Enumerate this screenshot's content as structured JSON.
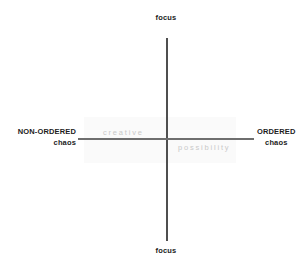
{
  "diagram": {
    "background_color": "#ffffff",
    "axes": {
      "vertical": {
        "label_top": "focus",
        "label_bottom": "focus",
        "color": "#4f4f4f"
      },
      "horizontal": {
        "color": "#6e6e6e"
      }
    },
    "poles": {
      "top": {
        "primary": "focus"
      },
      "bottom": {
        "primary": "focus"
      },
      "left": {
        "primary": "NON-ORDERED",
        "secondary": "chaos"
      },
      "right": {
        "primary": "ORDERED",
        "secondary": "chaos"
      }
    },
    "interior_words": {
      "upper_left": "creative",
      "lower_right": "possibility",
      "color": "#c9c9c9"
    }
  }
}
